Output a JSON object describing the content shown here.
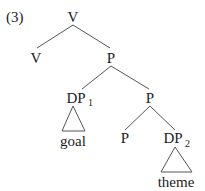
{
  "example_number": "(3)",
  "tree": {
    "root": {
      "label": "V"
    },
    "v_head": {
      "label": "V"
    },
    "p_bar_top": {
      "label": "P"
    },
    "dp1": {
      "label": "DP",
      "subscript": "1",
      "content": "goal"
    },
    "p_bar_lower": {
      "label": "P"
    },
    "p_head": {
      "label": "P"
    },
    "dp2": {
      "label": "DP",
      "subscript": "2",
      "content": "theme"
    }
  },
  "colors": {
    "text": "#222222",
    "lines": "#555555",
    "background": "#ffffff"
  }
}
